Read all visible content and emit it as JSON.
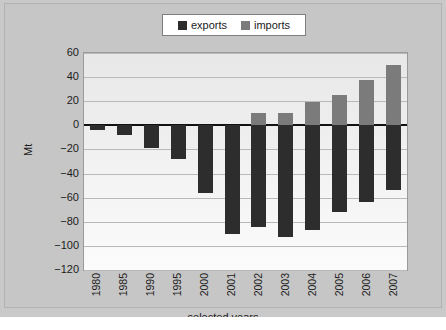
{
  "chart_data": {
    "type": "bar",
    "title": "",
    "xlabel": "selected years",
    "ylabel": "Mt",
    "ylim": [
      -120,
      60
    ],
    "ytick_step": 20,
    "grid": true,
    "legend_position": "top-center",
    "categories": [
      "1980",
      "1985",
      "1990",
      "1995",
      "2000",
      "2001",
      "2002",
      "2003",
      "2004",
      "2005",
      "2006",
      "2007"
    ],
    "series": [
      {
        "name": "exports",
        "color": "#2d2d2d",
        "values": [
          -4,
          -8,
          -19,
          -28,
          -56,
          -90,
          -84,
          -93,
          -87,
          -72,
          -64,
          -54
        ]
      },
      {
        "name": "imports",
        "color": "#7b7b7b",
        "values": [
          0,
          0,
          0,
          0,
          0,
          0,
          10,
          10,
          19,
          25,
          38,
          50
        ]
      }
    ],
    "yticks": [
      "60",
      "40",
      "20",
      "0",
      "-20",
      "-40",
      "-60",
      "-80",
      "-100",
      "-120"
    ],
    "ytick_values": [
      60,
      40,
      20,
      0,
      -20,
      -40,
      -60,
      -80,
      -100,
      -120
    ]
  },
  "legend": {
    "items": [
      {
        "label": "exports",
        "color": "#2d2d2d"
      },
      {
        "label": "imports",
        "color": "#7b7b7b"
      }
    ]
  },
  "figure": {
    "background": "#c6c6c6",
    "plot_background": "#f2f2f2",
    "caption": ""
  }
}
